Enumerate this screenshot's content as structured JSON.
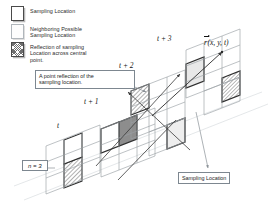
{
  "figure": {
    "type": "diagram"
  },
  "legend": {
    "items": [
      {
        "swatch": "white-square-icon",
        "label": "Sampling Location"
      },
      {
        "swatch": "outline-square-icon",
        "label": "Neighboring Possible\nSampling Location"
      },
      {
        "swatch": "hatched-square-icon",
        "label": "Reflection of sampling\nLocation across central\npoint."
      }
    ]
  },
  "callouts": {
    "reflection": "A point reflection of the\nsampling location.",
    "sampling": "Sampling Location"
  },
  "labels": {
    "n": "n = 3",
    "t": "t",
    "t1": "t + 1",
    "t2": "t + 2",
    "t3": "t + 3",
    "vector_r": "r",
    "vector_args": "(x, y, t)"
  },
  "colors": {
    "ink": "#121212",
    "grid_line": "#9aa0a6",
    "highlight_border": "#2f2f2f",
    "hatch": "#6e6e6e",
    "center_fill": "#8d8d8d",
    "callout_border": "#7d8790",
    "axis_line": "#c9cdd1"
  },
  "grid": {
    "planes": 4,
    "rows": 3,
    "cols": 3,
    "plane_names": [
      "t",
      "t + 1",
      "t + 2",
      "t + 3"
    ]
  }
}
